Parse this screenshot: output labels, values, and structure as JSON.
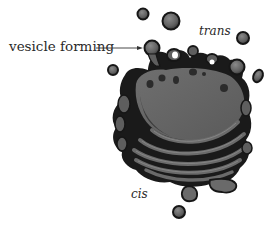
{
  "diagram": {
    "labels": {
      "vesicle_forming": "vesicle forming",
      "trans": "trans",
      "cis": "cis"
    },
    "colors": {
      "fill": "#6b6b6b",
      "outline": "#161616",
      "text": "#2a2a2a",
      "background": "#ffffff"
    }
  }
}
